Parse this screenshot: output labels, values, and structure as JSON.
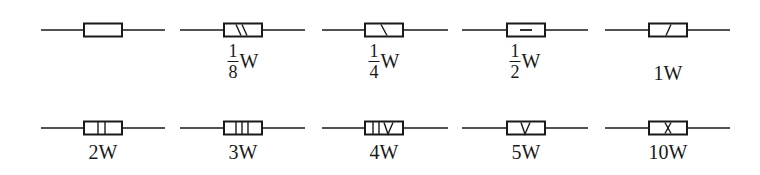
{
  "stroke_color": "#1a1a1a",
  "symbols": [
    {
      "id": "generic",
      "label": "",
      "marking": "none"
    },
    {
      "id": "1-8w",
      "label": {
        "num": "1",
        "den": "8",
        "unit": "W"
      },
      "marking": "two-backslashes"
    },
    {
      "id": "1-4w",
      "label": {
        "num": "1",
        "den": "4",
        "unit": "W"
      },
      "marking": "one-backslash"
    },
    {
      "id": "1-2w",
      "label": {
        "num": "1",
        "den": "2",
        "unit": "W"
      },
      "marking": "horizontal-dash"
    },
    {
      "id": "1w",
      "label": "1W",
      "marking": "one-slash"
    },
    {
      "id": "2w",
      "label": "2W",
      "marking": "two-vertical-bars"
    },
    {
      "id": "3w",
      "label": "3W",
      "marking": "three-vertical-bars"
    },
    {
      "id": "4w",
      "label": "4W",
      "marking": "two-bars-and-v"
    },
    {
      "id": "5w",
      "label": "5W",
      "marking": "v"
    },
    {
      "id": "10w",
      "label": "10W",
      "marking": "x"
    }
  ]
}
